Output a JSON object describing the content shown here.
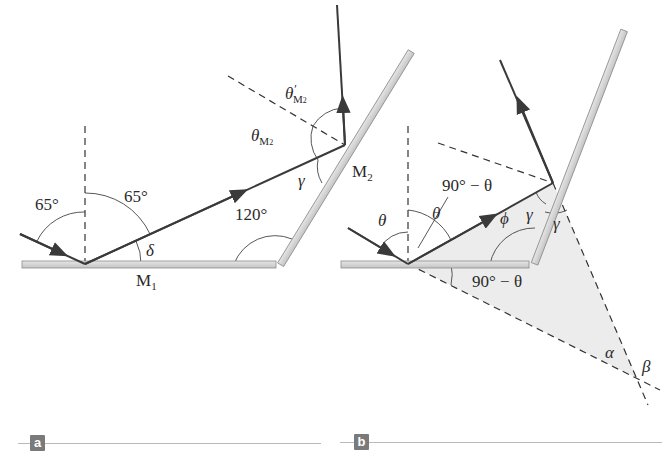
{
  "panels": [
    {
      "tag": "a",
      "labels": {
        "incidence_angle": "65°",
        "reflection_angle": "65°",
        "delta": "δ",
        "mirror1": "M",
        "mirror1_sub": "1",
        "mirror2": "M",
        "mirror2_sub": "2",
        "angle_between_mirrors": "120°",
        "gamma": "γ",
        "theta_m2": "θ",
        "theta_m2_sub": "M",
        "theta_m2_sub2": "2",
        "theta_prime_m2": "θ",
        "theta_prime_mark": "′",
        "theta_prime_m2_sub": "M",
        "theta_prime_m2_sub2": "2"
      }
    },
    {
      "tag": "b",
      "labels": {
        "theta_incident": "θ",
        "theta_reflected": "θ",
        "ninety_minus_theta_top": "90° − θ",
        "ninety_minus_theta_bottom": "90° − θ",
        "phi": "ϕ",
        "gamma_inner": "γ",
        "gamma_outer": "γ",
        "alpha": "α",
        "beta": "β"
      }
    }
  ],
  "colors": {
    "ray": "#3a3a3a",
    "mirror_fill": "#d4d4d4",
    "mirror_edge": "#8c8c8c",
    "shade": "#ececec",
    "tag_bg": "#7a7a7a",
    "rule": "#b9b9b9"
  }
}
